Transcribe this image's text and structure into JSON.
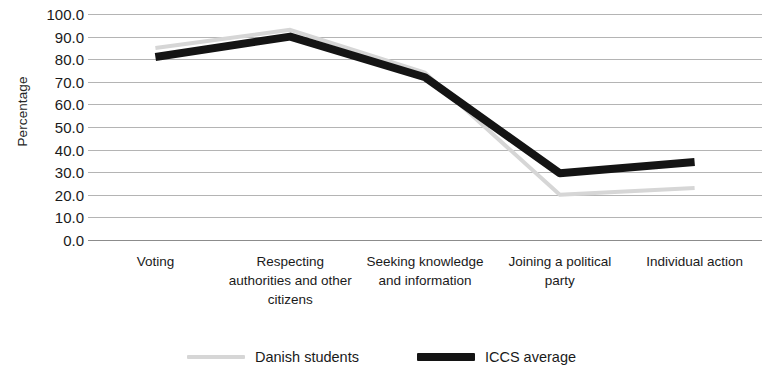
{
  "chart_data": {
    "type": "line",
    "title": "",
    "xlabel": "",
    "ylabel": "Percentage",
    "ylim": [
      0,
      100
    ],
    "ytick_step": 10,
    "grid": true,
    "legend_position": "bottom",
    "categories": [
      "Voting",
      "Respecting authorities and other citizens",
      "Seeking knowledge and information",
      "Joining a political party",
      "Individual action"
    ],
    "ytick_labels": [
      "100.0",
      "90.0",
      "80.0",
      "70.0",
      "60.0",
      "50.0",
      "40.0",
      "30.0",
      "20.0",
      "10.0",
      "0.0"
    ],
    "ytick_values": [
      100,
      90,
      80,
      70,
      60,
      50,
      40,
      30,
      20,
      10,
      0
    ],
    "series": [
      {
        "name": "Danish students",
        "color": "#d6d6d6",
        "width": 4,
        "values": [
          85.0,
          93.0,
          74.0,
          20.0,
          23.0
        ]
      },
      {
        "name": "ICCS average",
        "color": "#141414",
        "width": 8,
        "values": [
          81.0,
          90.0,
          72.0,
          29.5,
          34.5
        ]
      }
    ]
  },
  "legend": {
    "entries": [
      {
        "label": "Danish students"
      },
      {
        "label": "ICCS average"
      }
    ]
  }
}
